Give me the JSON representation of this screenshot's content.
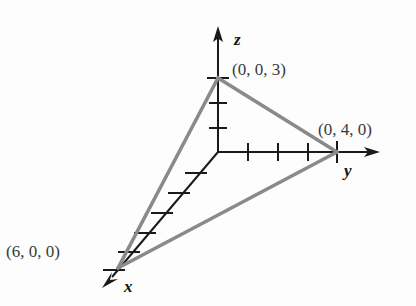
{
  "figure": {
    "background_color": "#fdfdfd",
    "axis_color": "#1a1a1a",
    "triangle_color": "#8a8a8a"
  },
  "axes": [
    {
      "key": "x",
      "label": "x",
      "label_style": "bold-italic-serif",
      "direction": "down-left",
      "tick_count": 6,
      "origin_px": [
        218,
        152
      ],
      "tip_px": [
        105,
        285
      ]
    },
    {
      "key": "y",
      "label": "y",
      "label_style": "bold-italic-serif",
      "direction": "right",
      "tick_count": 4,
      "origin_px": [
        218,
        152
      ],
      "tip_px": [
        378,
        152
      ]
    },
    {
      "key": "z",
      "label": "z",
      "label_style": "bold-italic-serif",
      "direction": "up",
      "tick_count": 3,
      "origin_px": [
        218,
        152
      ],
      "tip_px": [
        218,
        30
      ]
    }
  ],
  "vertices": [
    {
      "name": "z-intercept",
      "label": "(0, 0, 3)",
      "coords": [
        0,
        0,
        3
      ],
      "point_px": [
        218,
        78
      ],
      "label_px": [
        233,
        70
      ]
    },
    {
      "name": "y-intercept",
      "label": "(0, 4, 0)",
      "coords": [
        0,
        4,
        0
      ],
      "point_px": [
        337,
        152
      ],
      "label_px": [
        318,
        130
      ]
    },
    {
      "name": "x-intercept",
      "label": "(6, 0, 0)",
      "coords": [
        6,
        0,
        0
      ],
      "point_px": [
        118,
        268
      ],
      "label_px": [
        8,
        252
      ]
    }
  ],
  "triangle": {
    "name": "plane-triangle",
    "edges": [
      [
        "z-intercept",
        "y-intercept"
      ],
      [
        "y-intercept",
        "x-intercept"
      ],
      [
        "x-intercept",
        "z-intercept"
      ]
    ]
  }
}
